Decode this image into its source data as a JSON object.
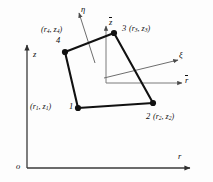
{
  "figure": {
    "type": "finite-element-quadrilateral"
  },
  "global_axes": {
    "origin_label": "o",
    "vertical_label": "z",
    "horizontal_label": "r"
  },
  "local_axes": {
    "vertical_label": "z",
    "vertical_overbar": true,
    "horizontal_label": "r",
    "horizontal_overbar": true
  },
  "natural_axes": {
    "eta_label": "η",
    "xi_label": "ξ"
  },
  "nodes": [
    {
      "id": "1",
      "number": "1",
      "coord_open": "(",
      "coord_r": "r",
      "coord_r_sub": "1",
      "coord_sep": ", ",
      "coord_z": "z",
      "coord_z_sub": "1",
      "coord_close": ")",
      "x": 78,
      "y": 108,
      "label_side": "left"
    },
    {
      "id": "2",
      "number": "2",
      "coord_open": "(",
      "coord_r": "r",
      "coord_r_sub": "2",
      "coord_sep": ", ",
      "coord_z": "z",
      "coord_z_sub": "2",
      "coord_close": ")",
      "x": 153,
      "y": 103,
      "label_side": "right"
    },
    {
      "id": "3",
      "number": "3",
      "coord_open": "(",
      "coord_r": "r",
      "coord_r_sub": "3",
      "coord_sep": ", ",
      "coord_z": "z",
      "coord_z_sub": "3",
      "coord_close": ")",
      "x": 114,
      "y": 33,
      "label_side": "right"
    },
    {
      "id": "4",
      "number": "4",
      "coord_open": "(",
      "coord_r": "r",
      "coord_r_sub": "4",
      "coord_sep": ", ",
      "coord_z": "z",
      "coord_z_sub": "4",
      "coord_close": ")",
      "x": 65,
      "y": 52,
      "label_side": "above"
    }
  ],
  "colors": {
    "element_stroke": "#111111",
    "axis_stroke": "#3a3a3a",
    "thin_stroke": "#6e6e6e",
    "node_fill": "#111111",
    "background": "#fdfdfd"
  }
}
